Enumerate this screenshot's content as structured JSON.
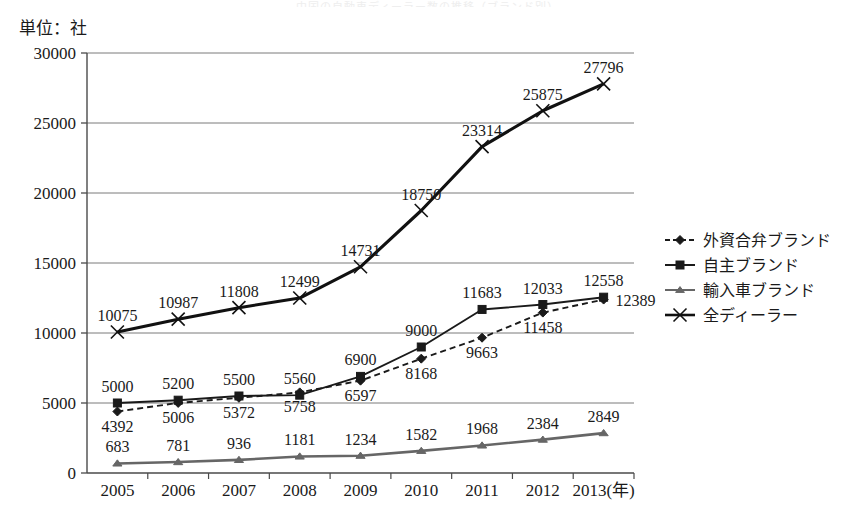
{
  "title_faint": "中国の自動車ディーラー数の推移（ブランド別）",
  "axis": {
    "unit_note": "単位：社",
    "x_axis_suffix": "(年)",
    "y_ticks": [
      "30000",
      "25000",
      "20000",
      "15000",
      "10000",
      "5000",
      "0"
    ],
    "x_ticks": [
      "2005",
      "2006",
      "2007",
      "2008",
      "2009",
      "2010",
      "2011",
      "2012",
      "2013"
    ],
    "x_last_label": "2013(年)"
  },
  "legend": {
    "items": [
      {
        "label": "外資合弁ブランド",
        "marker": "diamond-marker",
        "dash": true,
        "color": "#1a1a1a"
      },
      {
        "label": "自主ブランド",
        "marker": "square-marker",
        "dash": false,
        "color": "#1a1a1a"
      },
      {
        "label": "輸入車ブランド",
        "marker": "triangle-marker",
        "dash": false,
        "color": "#666666"
      },
      {
        "label": "全ディーラー",
        "marker": "cross-marker",
        "dash": false,
        "color": "#111111"
      }
    ]
  },
  "chart_data": {
    "type": "line",
    "title": "中国の自動車ディーラー数の推移（ブランド別）",
    "xlabel": "(年)",
    "ylabel": "単位：社",
    "grid": true,
    "legend_position": "right",
    "ylim": [
      0,
      30000
    ],
    "ytick_step": 5000,
    "categories": [
      "2005",
      "2006",
      "2007",
      "2008",
      "2009",
      "2010",
      "2011",
      "2012",
      "2013"
    ],
    "series": [
      {
        "name": "外資合弁ブランド",
        "marker": "diamond",
        "linestyle": "dashed",
        "color": "#1a1a1a",
        "values": [
          4392,
          5006,
          5372,
          5758,
          6597,
          8168,
          9663,
          11458,
          12389
        ],
        "label_positions": [
          "below",
          "below",
          "below",
          "below",
          "below",
          "below",
          "below",
          "below",
          "right"
        ]
      },
      {
        "name": "自主ブランド",
        "marker": "square",
        "linestyle": "solid",
        "color": "#1a1a1a",
        "values": [
          5000,
          5200,
          5500,
          5560,
          6900,
          9000,
          11683,
          12033,
          12558
        ],
        "label_positions": [
          "above",
          "above",
          "above",
          "above",
          "above",
          "above",
          "above",
          "above",
          "above"
        ]
      },
      {
        "name": "輸入車ブランド",
        "marker": "triangle",
        "linestyle": "solid",
        "color": "#666666",
        "values": [
          683,
          781,
          936,
          1181,
          1234,
          1582,
          1968,
          2384,
          2849
        ],
        "label_positions": [
          "above",
          "above",
          "above",
          "above",
          "above",
          "above",
          "above",
          "above",
          "above"
        ]
      },
      {
        "name": "全ディーラー",
        "marker": "cross",
        "linestyle": "solid",
        "color": "#111111",
        "values": [
          10075,
          10987,
          11808,
          12499,
          14731,
          18750,
          23314,
          25875,
          27796
        ],
        "label_positions": [
          "above",
          "above",
          "above",
          "above",
          "above",
          "above",
          "above",
          "above",
          "above"
        ]
      }
    ]
  },
  "colors": {
    "grid": "#7a7a7a",
    "axis": "#4a4a4a",
    "text": "#1a1a1a",
    "import_series": "#666666"
  }
}
